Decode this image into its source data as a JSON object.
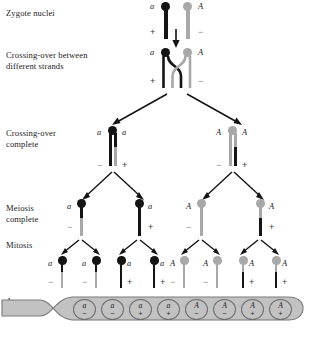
{
  "figure": {
    "organism_stage_labels": [
      {
        "id": "zygote",
        "text": "Zygote nuclei"
      },
      {
        "id": "crossing-over-between",
        "text": "Crossing-over between\ndifferent strands"
      },
      {
        "id": "crossing-over-complete",
        "text": "Crossing-over\ncomplete"
      },
      {
        "id": "meiosis-complete",
        "text": "Meiosis\ncomplete"
      },
      {
        "id": "mitosis",
        "text": "Mitosis"
      },
      {
        "id": "ascus",
        "text": "Ascus"
      }
    ],
    "colors": {
      "dark_strand": "#141414",
      "light_strand": "#a8a8a8",
      "ascus_fill": "#c2c2c2",
      "ascus_outline": "#6d6d6d",
      "background": "#ffffff"
    }
  },
  "zygote": {
    "chromosomes": [
      {
        "allele": "a",
        "sign": "+",
        "color": "dark",
        "allele_side": "left",
        "sign_side": "left"
      },
      {
        "allele": "A",
        "sign": "−",
        "color": "light",
        "allele_side": "right",
        "sign_side": "right"
      }
    ],
    "arrow": "down-arrow"
  },
  "crossing_over": {
    "chromosomes": [
      {
        "allele": "a",
        "sign": "+",
        "color": "dark",
        "allele_side": "left",
        "sign_side": "left"
      },
      {
        "allele": "A",
        "sign": "−",
        "color": "light",
        "allele_side": "right",
        "sign_side": "right"
      }
    ],
    "note": "chiasma between non-sister chromatids of different strands"
  },
  "crossing_over_complete": {
    "bivalents": [
      {
        "allele_left": "a",
        "allele_right": "a",
        "sign_left": "−",
        "sign_right": "+",
        "centromere_color": "dark",
        "chromatids": [
          {
            "top_color": "dark",
            "bottom_color": "dark"
          },
          {
            "top_color": "dark",
            "bottom_color": "light"
          }
        ]
      },
      {
        "allele_left": "A",
        "allele_right": "A",
        "sign_left": "−",
        "sign_right": "+",
        "centromere_color": "light",
        "chromatids": [
          {
            "top_color": "light",
            "bottom_color": "light"
          },
          {
            "top_color": "light",
            "bottom_color": "dark"
          }
        ]
      }
    ]
  },
  "meiosis_complete": {
    "products": [
      {
        "allele": "a",
        "sign": "−",
        "allele_side": "left",
        "sign_side": "left",
        "centromere_color": "dark",
        "top_color": "dark",
        "bottom_color": "light"
      },
      {
        "allele": "a",
        "sign": "+",
        "allele_side": "right",
        "sign_side": "right",
        "centromere_color": "dark",
        "top_color": "dark",
        "bottom_color": "dark"
      },
      {
        "allele": "A",
        "sign": "−",
        "allele_side": "left",
        "sign_side": "left",
        "centromere_color": "light",
        "top_color": "light",
        "bottom_color": "light"
      },
      {
        "allele": "A",
        "sign": "+",
        "allele_side": "right",
        "sign_side": "right",
        "centromere_color": "light",
        "top_color": "light",
        "bottom_color": "dark"
      }
    ]
  },
  "mitosis": {
    "products": [
      {
        "allele": "a",
        "sign": "−",
        "allele_side": "left",
        "sign_side": "left",
        "centromere_color": "dark",
        "top_color": "dark",
        "bottom_color": "light"
      },
      {
        "allele": "a",
        "sign": "−",
        "allele_side": "left",
        "sign_side": "left",
        "centromere_color": "dark",
        "top_color": "dark",
        "bottom_color": "light"
      },
      {
        "allele": "a",
        "sign": "+",
        "allele_side": "right",
        "sign_side": "right",
        "centromere_color": "dark",
        "top_color": "dark",
        "bottom_color": "dark"
      },
      {
        "allele": "a",
        "sign": "+",
        "allele_side": "right",
        "sign_side": "right",
        "centromere_color": "dark",
        "top_color": "dark",
        "bottom_color": "dark"
      },
      {
        "allele": "A",
        "sign": "−",
        "allele_side": "left",
        "sign_side": "left",
        "centromere_color": "light",
        "top_color": "light",
        "bottom_color": "light"
      },
      {
        "allele": "A",
        "sign": "−",
        "allele_side": "left",
        "sign_side": "left",
        "centromere_color": "light",
        "top_color": "light",
        "bottom_color": "light"
      },
      {
        "allele": "A",
        "sign": "+",
        "allele_side": "right",
        "sign_side": "right",
        "centromere_color": "light",
        "top_color": "light",
        "bottom_color": "dark"
      },
      {
        "allele": "A",
        "sign": "+",
        "allele_side": "right",
        "sign_side": "right",
        "centromere_color": "light",
        "top_color": "light",
        "bottom_color": "dark"
      }
    ]
  },
  "ascus": {
    "label": "Ascus",
    "spores": [
      {
        "allele": "a",
        "sign": "−"
      },
      {
        "allele": "a",
        "sign": "−"
      },
      {
        "allele": "a",
        "sign": "+"
      },
      {
        "allele": "a",
        "sign": "+"
      },
      {
        "allele": "A",
        "sign": "−"
      },
      {
        "allele": "A",
        "sign": "−"
      },
      {
        "allele": "A",
        "sign": "+"
      },
      {
        "allele": "A",
        "sign": "+"
      }
    ]
  }
}
